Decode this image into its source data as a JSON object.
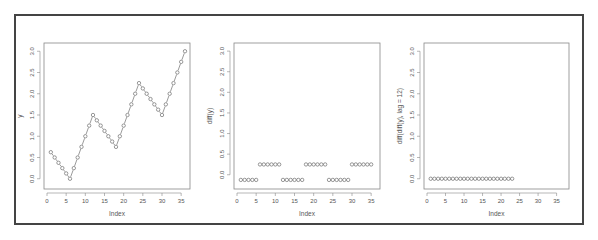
{
  "colors": {
    "frame": "#444444",
    "axis": "#888888",
    "points": "#555555",
    "text": "#555555"
  },
  "chart_data": [
    {
      "type": "scatter",
      "title": "",
      "xlabel": "Index",
      "ylabel": "y",
      "xlim": [
        0,
        36
      ],
      "ylim": [
        -0.1,
        3.1
      ],
      "xticks": [
        0,
        5,
        10,
        15,
        20,
        25,
        30,
        35
      ],
      "yticks": [
        0.0,
        0.5,
        1.0,
        1.5,
        2.0,
        2.5,
        3.0
      ],
      "ytick_labels": [
        "0.0",
        "0.5",
        "1.0",
        "1.5",
        "2.0",
        "2.5",
        "3.0"
      ],
      "connected": true,
      "x": [
        1,
        2,
        3,
        4,
        5,
        6,
        7,
        8,
        9,
        10,
        11,
        12,
        13,
        14,
        15,
        16,
        17,
        18,
        19,
        20,
        21,
        22,
        23,
        24,
        25,
        26,
        27,
        28,
        29,
        30,
        31,
        32,
        33,
        34,
        35,
        36
      ],
      "values": [
        0.625,
        0.5,
        0.375,
        0.25,
        0.125,
        0.0,
        0.25,
        0.5,
        0.75,
        1.0,
        1.25,
        1.5,
        1.375,
        1.25,
        1.125,
        1.0,
        0.875,
        0.75,
        1.0,
        1.25,
        1.5,
        1.75,
        2.0,
        2.25,
        2.125,
        2.0,
        1.875,
        1.75,
        1.625,
        1.5,
        1.75,
        2.0,
        2.25,
        2.5,
        2.75,
        3.0
      ]
    },
    {
      "type": "scatter",
      "title": "",
      "xlabel": "Index",
      "ylabel": "diff(y)",
      "xlim": [
        0,
        36
      ],
      "ylim": [
        -0.2,
        3.1
      ],
      "xticks": [
        0,
        5,
        10,
        15,
        20,
        25,
        30,
        35
      ],
      "yticks": [
        0.0,
        0.5,
        1.0,
        1.5,
        2.0,
        2.5,
        3.0
      ],
      "ytick_labels": [
        "0.0",
        "0.5",
        "1.0",
        "1.5",
        "2.0",
        "2.5",
        "3.0"
      ],
      "connected": false,
      "x": [
        1,
        2,
        3,
        4,
        5,
        6,
        7,
        8,
        9,
        10,
        11,
        12,
        13,
        14,
        15,
        16,
        17,
        18,
        19,
        20,
        21,
        22,
        23,
        24,
        25,
        26,
        27,
        28,
        29,
        30,
        31,
        32,
        33,
        34,
        35
      ],
      "values": [
        -0.125,
        -0.125,
        -0.125,
        -0.125,
        -0.125,
        0.25,
        0.25,
        0.25,
        0.25,
        0.25,
        0.25,
        -0.125,
        -0.125,
        -0.125,
        -0.125,
        -0.125,
        -0.125,
        0.25,
        0.25,
        0.25,
        0.25,
        0.25,
        0.25,
        -0.125,
        -0.125,
        -0.125,
        -0.125,
        -0.125,
        -0.125,
        0.25,
        0.25,
        0.25,
        0.25,
        0.25,
        0.25
      ]
    },
    {
      "type": "scatter",
      "title": "",
      "xlabel": "Index",
      "ylabel": "diff(diff(y), lag = 12)",
      "xlim": [
        0,
        37
      ],
      "ylim": [
        -0.1,
        3.1
      ],
      "xticks": [
        0,
        5,
        10,
        15,
        20,
        25,
        30,
        35
      ],
      "yticks": [
        0.0,
        0.5,
        1.0,
        1.5,
        2.0,
        2.5,
        3.0
      ],
      "ytick_labels": [
        "0.0",
        "0.5",
        "1.0",
        "1.5",
        "2.0",
        "2.5",
        "3.0"
      ],
      "connected": false,
      "x": [
        1,
        2,
        3,
        4,
        5,
        6,
        7,
        8,
        9,
        10,
        11,
        12,
        13,
        14,
        15,
        16,
        17,
        18,
        19,
        20,
        21,
        22,
        23
      ],
      "values": [
        0,
        0,
        0,
        0,
        0,
        0,
        0,
        0,
        0,
        0,
        0,
        0,
        0,
        0,
        0,
        0,
        0,
        0,
        0,
        0,
        0,
        0,
        0
      ]
    }
  ],
  "panels": [
    {
      "box": [
        44,
        43,
        190,
        189
      ]
    },
    {
      "box": [
        234,
        43,
        380,
        189
      ]
    },
    {
      "box": [
        424,
        43,
        569,
        189
      ]
    }
  ]
}
